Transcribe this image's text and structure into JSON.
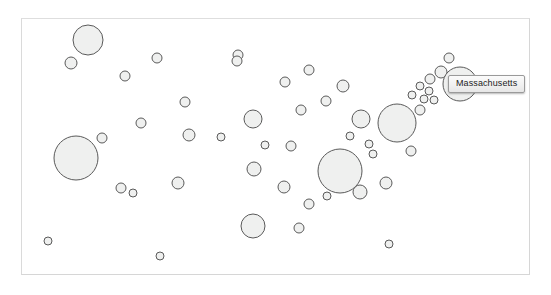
{
  "chart_data": {
    "type": "scatter",
    "title": "",
    "subtitle": "",
    "xlabel": "",
    "ylabel": "",
    "grid": false,
    "legend_position": "none",
    "axis_visible": false,
    "plot_area": {
      "x": 21,
      "y": 18,
      "width": 509,
      "height": 257
    },
    "bubble_style": {
      "fill": "#eff0ef",
      "stroke": "#5a5a5a",
      "stroke_width": 1,
      "opacity": 1
    },
    "encoding": {
      "x": "longitude-like position",
      "y": "latitude-like position",
      "size": "value radius in px"
    },
    "points": [
      {
        "name": "point-01",
        "x": 88,
        "y": 40,
        "r": 15
      },
      {
        "name": "point-02",
        "x": 71,
        "y": 63,
        "r": 6
      },
      {
        "name": "point-03",
        "x": 125,
        "y": 76,
        "r": 5
      },
      {
        "name": "point-04",
        "x": 157,
        "y": 58,
        "r": 5
      },
      {
        "name": "point-05",
        "x": 185,
        "y": 102,
        "r": 5
      },
      {
        "name": "point-06",
        "x": 238,
        "y": 55,
        "r": 5
      },
      {
        "name": "point-07",
        "x": 141,
        "y": 123,
        "r": 5
      },
      {
        "name": "point-08",
        "x": 189,
        "y": 135,
        "r": 6
      },
      {
        "name": "point-09",
        "x": 221,
        "y": 137,
        "r": 4
      },
      {
        "name": "point-10",
        "x": 253,
        "y": 119,
        "r": 9
      },
      {
        "name": "point-11",
        "x": 254,
        "y": 169,
        "r": 7
      },
      {
        "name": "point-12",
        "x": 285,
        "y": 82,
        "r": 5
      },
      {
        "name": "point-13",
        "x": 237,
        "y": 61,
        "r": 5
      },
      {
        "name": "point-14",
        "x": 265,
        "y": 145,
        "r": 4
      },
      {
        "name": "point-15",
        "x": 291,
        "y": 146,
        "r": 5
      },
      {
        "name": "point-16",
        "x": 301,
        "y": 110,
        "r": 5
      },
      {
        "name": "point-17",
        "x": 309,
        "y": 70,
        "r": 5
      },
      {
        "name": "point-18",
        "x": 326,
        "y": 101,
        "r": 5
      },
      {
        "name": "point-19",
        "x": 343,
        "y": 86,
        "r": 6
      },
      {
        "name": "point-20",
        "x": 361,
        "y": 119,
        "r": 9
      },
      {
        "name": "point-21",
        "x": 340,
        "y": 171,
        "r": 22
      },
      {
        "name": "point-22",
        "x": 284,
        "y": 187,
        "r": 6
      },
      {
        "name": "point-23",
        "x": 309,
        "y": 204,
        "r": 5
      },
      {
        "name": "point-24",
        "x": 327,
        "y": 196,
        "r": 4
      },
      {
        "name": "point-25",
        "x": 299,
        "y": 228,
        "r": 5
      },
      {
        "name": "point-26",
        "x": 360,
        "y": 192,
        "r": 7
      },
      {
        "name": "point-27",
        "x": 386,
        "y": 183,
        "r": 6
      },
      {
        "name": "point-28",
        "x": 397,
        "y": 123,
        "r": 19
      },
      {
        "name": "point-29",
        "x": 369,
        "y": 144,
        "r": 4
      },
      {
        "name": "point-30",
        "x": 411,
        "y": 151,
        "r": 5
      },
      {
        "name": "point-31",
        "x": 420,
        "y": 110,
        "r": 5
      },
      {
        "name": "point-32",
        "x": 424,
        "y": 99,
        "r": 4
      },
      {
        "name": "point-33",
        "x": 412,
        "y": 95,
        "r": 4
      },
      {
        "name": "point-34",
        "x": 420,
        "y": 86,
        "r": 4
      },
      {
        "name": "point-35",
        "x": 429,
        "y": 91,
        "r": 4
      },
      {
        "name": "point-36",
        "x": 434,
        "y": 100,
        "r": 4
      },
      {
        "name": "point-37",
        "x": 430,
        "y": 79,
        "r": 5
      },
      {
        "name": "point-38",
        "x": 441,
        "y": 72,
        "r": 6
      },
      {
        "name": "point-39",
        "x": 449,
        "y": 58,
        "r": 5
      },
      {
        "name": "point-40",
        "x": 460,
        "y": 84,
        "r": 17
      },
      {
        "name": "point-41",
        "x": 121,
        "y": 188,
        "r": 5
      },
      {
        "name": "point-42",
        "x": 178,
        "y": 183,
        "r": 6
      },
      {
        "name": "point-43",
        "x": 76,
        "y": 158,
        "r": 22
      },
      {
        "name": "point-44",
        "x": 102,
        "y": 138,
        "r": 5
      },
      {
        "name": "point-45",
        "x": 133,
        "y": 193,
        "r": 4
      },
      {
        "name": "point-46",
        "x": 48,
        "y": 241,
        "r": 4
      },
      {
        "name": "point-47",
        "x": 160,
        "y": 256,
        "r": 4
      },
      {
        "name": "point-48",
        "x": 253,
        "y": 226,
        "r": 12
      },
      {
        "name": "point-49",
        "x": 389,
        "y": 244,
        "r": 4
      },
      {
        "name": "point-50",
        "x": 373,
        "y": 154,
        "r": 4
      },
      {
        "name": "point-51",
        "x": 350,
        "y": 136,
        "r": 4
      }
    ]
  },
  "tooltip": {
    "label": "Massachusetts",
    "visible": true,
    "x": 448,
    "y": 75,
    "background": "#f0f0f0",
    "border_color": "#9a9a9a",
    "text_color": "#1b1b1b"
  },
  "frame": {
    "border_color": "#d6d6d6",
    "background": "#ffffff"
  }
}
